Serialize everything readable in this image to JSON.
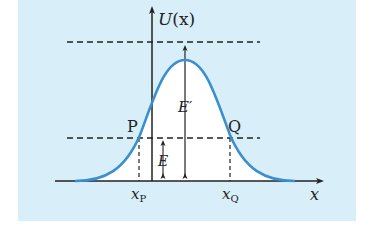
{
  "figure": {
    "type": "potential-energy-barrier",
    "background_color": "#d8eef8",
    "curve_color": "#3a8fd0",
    "axis_color": "#222222"
  },
  "axes": {
    "y_label_func": "U",
    "y_label_arg": "(x)",
    "x_label": "x"
  },
  "points": {
    "P": {
      "label": "P",
      "x_label": "x",
      "x_sub": "P"
    },
    "Q": {
      "label": "Q",
      "x_label": "x",
      "x_sub": "Q"
    }
  },
  "energies": {
    "E": {
      "label": "E"
    },
    "E_prime": {
      "label": "E",
      "prime": "′"
    }
  }
}
